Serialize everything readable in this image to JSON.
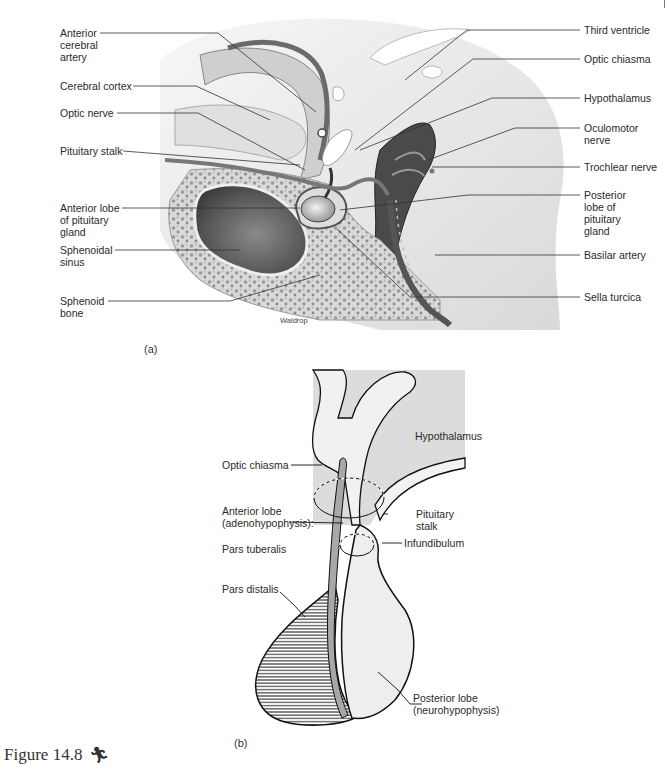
{
  "figure": {
    "caption": "Figure 14.8",
    "caption_icon": "running-figure-icon",
    "artist_credit": "Waldrop"
  },
  "panel_a": {
    "tag": "(a)",
    "labels_left": [
      {
        "id": "anterior-cerebral-artery",
        "lines": [
          "Anterior",
          "cerebral",
          "artery"
        ]
      },
      {
        "id": "cerebral-cortex",
        "lines": [
          "Cerebral cortex"
        ]
      },
      {
        "id": "optic-nerve",
        "lines": [
          "Optic nerve"
        ]
      },
      {
        "id": "pituitary-stalk",
        "lines": [
          "Pituitary stalk"
        ]
      },
      {
        "id": "anterior-lobe",
        "lines": [
          "Anterior lobe",
          "of pituitary",
          "gland"
        ]
      },
      {
        "id": "sphenoidal-sinus",
        "lines": [
          "Sphenoidal",
          "sinus"
        ]
      },
      {
        "id": "sphenoid-bone",
        "lines": [
          "Sphenoid",
          "bone"
        ]
      }
    ],
    "labels_right": [
      {
        "id": "third-ventricle",
        "lines": [
          "Third ventricle"
        ]
      },
      {
        "id": "optic-chiasma",
        "lines": [
          "Optic chiasma"
        ]
      },
      {
        "id": "hypothalamus",
        "lines": [
          "Hypothalamus"
        ]
      },
      {
        "id": "oculomotor-nerve",
        "lines": [
          "Oculomotor",
          "nerve"
        ]
      },
      {
        "id": "trochlear-nerve",
        "lines": [
          "Trochlear nerve"
        ]
      },
      {
        "id": "posterior-lobe",
        "lines": [
          "Posterior",
          "lobe of",
          "pituitary",
          "gland"
        ]
      },
      {
        "id": "basilar-artery",
        "lines": [
          "Basilar artery"
        ]
      },
      {
        "id": "sella-turcica",
        "lines": [
          "Sella turcica"
        ]
      }
    ]
  },
  "panel_b": {
    "tag": "(b)",
    "labels": {
      "hypothalamus": "Hypothalamus",
      "optic_chiasma": "Optic chiasma",
      "anterior_lobe_1": "Anterior lobe",
      "anterior_lobe_2": "(adenohypophysis):",
      "pars_tuberalis": "Pars tuberalis",
      "pituitary_stalk_1": "Pituitary",
      "pituitary_stalk_2": "stalk",
      "infundibulum": "Infundibulum",
      "pars_distalis": "Pars distalis",
      "posterior_lobe_1": "Posterior lobe",
      "posterior_lobe_2": "(neurohypophysis)"
    }
  },
  "colors": {
    "tissue_light": "#e6e6e6",
    "tissue_mid": "#bdbdbd",
    "tissue_dark": "#5a5a5a",
    "line": "#222222",
    "panel_b_bg": "#dcdcdc",
    "panel_b_stalk": "#a8a8a8"
  }
}
